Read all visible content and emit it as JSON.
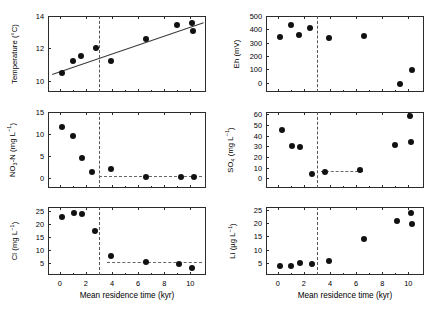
{
  "figure": {
    "xlabel": "Mean residence time (kyr)",
    "xticks": [
      0,
      2,
      4,
      6,
      8,
      10
    ],
    "xlim": [
      -0.9,
      11.2
    ],
    "threshold_kyr": 3.0
  },
  "chart_data": [
    {
      "id": "temperature",
      "type": "scatter",
      "title": "",
      "xlabel": "Mean residence time (kyr)",
      "ylabel": "Temperature (°C)",
      "ylabel_html": "Temperature (°C)",
      "xlim": [
        -0.9,
        11.2
      ],
      "ylim": [
        9.3,
        14.0
      ],
      "yticks": [
        10,
        12,
        14
      ],
      "yticklabels": [
        "10",
        "12",
        "14"
      ],
      "grid": false,
      "x": [
        0.2,
        1.0,
        1.6,
        2.8,
        3.9,
        6.6,
        9.0,
        10.1,
        10.2
      ],
      "values": [
        10.5,
        11.2,
        11.5,
        12.0,
        11.2,
        12.55,
        13.45,
        13.55,
        13.05
      ],
      "trendline": {
        "type": "line",
        "x0": -0.6,
        "y0": 10.4,
        "x1": 11.0,
        "y1": 13.6
      },
      "vertical_marker": 3.0
    },
    {
      "id": "eh",
      "type": "scatter",
      "title": "",
      "xlabel": "Mean residence time (kyr)",
      "ylabel": "Eh (mV)",
      "ylabel_html": "Eh (mV)",
      "xlim": [
        -0.9,
        11.2
      ],
      "ylim": [
        -70,
        500
      ],
      "yticks": [
        0,
        100,
        200,
        300,
        400,
        500
      ],
      "yticklabels": [
        "0",
        "100",
        "200",
        "300",
        "400",
        "500"
      ],
      "grid": false,
      "x": [
        0.2,
        1.0,
        1.6,
        2.5,
        3.9,
        6.6,
        9.4,
        10.3
      ],
      "values": [
        340,
        435,
        355,
        412,
        333,
        350,
        -8,
        95
      ],
      "vertical_marker": 3.0
    },
    {
      "id": "no3n",
      "type": "scatter",
      "title": "",
      "xlabel": "Mean residence time (kyr)",
      "ylabel": "NO3-N (mg L-1)",
      "ylabel_html": "NO<sub>3</sub>-N (mg L<sup>−1</sup>)",
      "xlim": [
        -0.9,
        11.2
      ],
      "ylim": [
        -2.2,
        15.0
      ],
      "yticks": [
        0,
        5,
        10,
        15
      ],
      "yticklabels": [
        "0",
        "5",
        "10",
        "15"
      ],
      "grid": false,
      "x": [
        0.2,
        1.0,
        1.7,
        2.5,
        3.9,
        6.6,
        9.3,
        10.3
      ],
      "values": [
        11.7,
        9.5,
        4.5,
        1.5,
        2.0,
        0.4,
        0.3,
        0.35
      ],
      "trendline": {
        "type": "hline",
        "x0": 3.0,
        "x1": 10.9,
        "y": 0.55
      },
      "vertical_marker": 3.0
    },
    {
      "id": "so4",
      "type": "scatter",
      "title": "",
      "xlabel": "Mean residence time (kyr)",
      "ylabel": "SO4 (mg L-1)",
      "ylabel_html": "SO<sub>4</sub> (mg L<sup>−1</sup>)",
      "xlim": [
        -0.9,
        11.2
      ],
      "ylim": [
        -9,
        62
      ],
      "yticks": [
        0,
        10,
        20,
        30,
        40,
        50,
        60
      ],
      "yticklabels": [
        "0",
        "10",
        "20",
        "30",
        "40",
        "50",
        "60"
      ],
      "grid": false,
      "x": [
        0.3,
        1.1,
        1.7,
        2.6,
        3.6,
        6.3,
        9.0,
        10.1,
        10.2
      ],
      "values": [
        45.5,
        30.5,
        29.5,
        4.5,
        5.5,
        7.5,
        31.5,
        58.0,
        34.0
      ],
      "trendline": {
        "type": "hline",
        "x0": 3.3,
        "x1": 6.5,
        "y": 6.5
      },
      "vertical_marker": 3.0
    },
    {
      "id": "cl",
      "type": "scatter",
      "title": "",
      "xlabel": "Mean residence time (kyr)",
      "ylabel": "Cl (mg L-1)",
      "ylabel_html": "Cl (mg L<sup>−1</sup>)",
      "xlim": [
        -0.9,
        11.2
      ],
      "ylim": [
        0.5,
        26.5
      ],
      "yticks": [
        5,
        10,
        15,
        20,
        25
      ],
      "yticklabels": [
        "5",
        "10",
        "15",
        "20",
        "25"
      ],
      "grid": false,
      "x": [
        0.2,
        1.1,
        1.7,
        2.7,
        3.9,
        6.6,
        9.1,
        10.1
      ],
      "values": [
        22.8,
        24.2,
        23.8,
        17.2,
        7.8,
        5.5,
        4.8,
        3.2
      ],
      "trendline": {
        "type": "hline",
        "x0": 3.6,
        "x1": 10.9,
        "y": 5.6
      },
      "vertical_marker": 3.0
    },
    {
      "id": "li",
      "type": "scatter",
      "title": "",
      "xlabel": "Mean residence time (kyr)",
      "ylabel": "Li (ug L-1)",
      "ylabel_html": "Li (µg L<sup>−1</sup>)",
      "xlim": [
        -0.9,
        11.2
      ],
      "ylim": [
        0.5,
        26.0
      ],
      "yticks": [
        5,
        10,
        15,
        20,
        25
      ],
      "yticklabels": [
        "5",
        "10",
        "15",
        "20",
        "25"
      ],
      "grid": false,
      "x": [
        0.2,
        1.0,
        1.7,
        2.6,
        3.9,
        6.6,
        9.1,
        10.2,
        10.3
      ],
      "values": [
        3.9,
        3.9,
        4.9,
        4.8,
        5.9,
        14.0,
        20.7,
        23.7,
        19.7
      ],
      "vertical_marker": 3.0
    }
  ]
}
